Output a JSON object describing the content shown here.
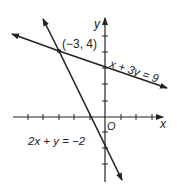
{
  "figure": {
    "type": "coordinate-graph",
    "axes": {
      "x_label": "x",
      "y_label": "y",
      "origin_label": "O"
    },
    "lines": [
      {
        "name": "line-1",
        "equation": "x + 3y = 9"
      },
      {
        "name": "line-2",
        "equation": "2x + y = −2"
      }
    ],
    "intersection": {
      "label": "(−3, 4)",
      "x": -3,
      "y": 4
    },
    "colors": {
      "ink": "#222222",
      "background": "#ffffff"
    }
  }
}
